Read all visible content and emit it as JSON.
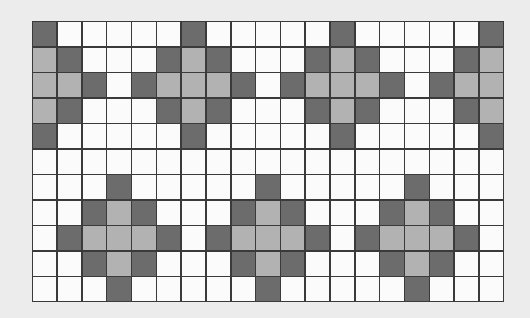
{
  "pattern": {
    "columns": 19,
    "rows": 11,
    "colors": {
      "empty": "#fbfbfb",
      "dark": "#6c6c6c",
      "light": "#b2b2b2",
      "gridline": "#3a3a3a",
      "background": "#ececec"
    },
    "legend": "W = white, D = dark gray, L = light gray",
    "grid": [
      "DWWWWWDWWWWWDWWWWWD",
      "LDWWWDLDWWWDLDWWWDL",
      "LLDWDLLLDWDLLLDWDLL",
      "LDWWWDLDWWWDLDWWWDL",
      "DWWWWWDWWWWWDWWWWWD",
      "WWWWWWWWWWWWWWWWWWW",
      "WWWDWWWWWDWWWWWDWWW",
      "WWDLDWWWDLDWWWDLDWW",
      "WDLLLDWDLLLDWDLLLDW",
      "WWDLDWWWDLDWWWDLDWW",
      "WWWDWWWWWDWWWWWDWWW"
    ]
  }
}
